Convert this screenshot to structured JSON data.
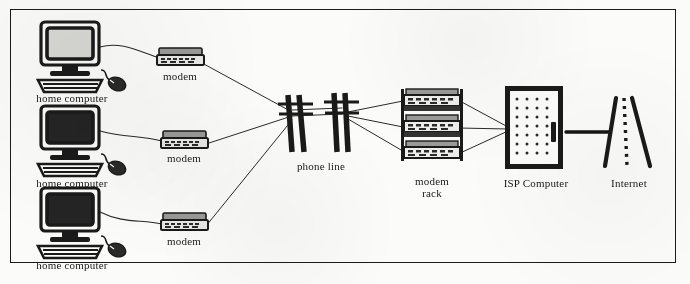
{
  "diagram": {
    "background_color": "#fbfbf9",
    "ink_color": "#1a1a1a",
    "border_color": "#1b1b1b",
    "style": "scanned black and white line drawing"
  },
  "nodes": [
    {
      "id": "home-computer-1",
      "label": "home computer",
      "icon": "desktop-computer-icon",
      "screen": "light",
      "x": 72,
      "y": 55,
      "label_x": 72,
      "label_y": 86
    },
    {
      "id": "home-computer-2",
      "label": "home computer",
      "icon": "desktop-computer-icon",
      "screen": "dark",
      "x": 72,
      "y": 140,
      "label_x": 72,
      "label_y": 171
    },
    {
      "id": "home-computer-3",
      "label": "home computer",
      "icon": "desktop-computer-icon",
      "screen": "dark",
      "x": 72,
      "y": 222,
      "label_x": 72,
      "label_y": 253
    },
    {
      "id": "modem-1",
      "label": "modem",
      "icon": "modem-icon",
      "x": 180,
      "y": 57,
      "label_x": 180,
      "label_y": 72
    },
    {
      "id": "modem-2",
      "label": "modem",
      "icon": "modem-icon",
      "x": 184,
      "y": 140,
      "label_x": 184,
      "label_y": 155
    },
    {
      "id": "modem-3",
      "label": "modem",
      "icon": "modem-icon",
      "x": 184,
      "y": 222,
      "label_x": 184,
      "label_y": 238
    },
    {
      "id": "phone-line",
      "label": "phone line",
      "icon": "telephone-pole-icon",
      "x": 320,
      "y": 125,
      "label_x": 321,
      "label_y": 160
    },
    {
      "id": "modem-rack",
      "label_line1": "modem",
      "label_line2": "rack",
      "icon": "modem-rack-icon",
      "units": 3,
      "x": 432,
      "y": 128,
      "label_x": 432,
      "label_y": 175
    },
    {
      "id": "isp-computer",
      "label": "ISP Computer",
      "icon": "server-cabinet-icon",
      "x": 535,
      "y": 128,
      "label_x": 535,
      "label_y": 177
    },
    {
      "id": "internet",
      "label": "Internet",
      "icon": "road-icon",
      "x": 626,
      "y": 130,
      "label_x": 628,
      "label_y": 177
    }
  ],
  "connections": [
    {
      "from": "home-computer-1",
      "to": "modem-1",
      "style": "thin-curve"
    },
    {
      "from": "home-computer-2",
      "to": "modem-2",
      "style": "thin-curve"
    },
    {
      "from": "home-computer-3",
      "to": "modem-3",
      "style": "thin-curve"
    },
    {
      "from": "modem-1",
      "to": "phone-line",
      "style": "thin-straight"
    },
    {
      "from": "modem-2",
      "to": "phone-line",
      "style": "thin-straight"
    },
    {
      "from": "modem-3",
      "to": "phone-line",
      "style": "thin-straight"
    },
    {
      "from": "phone-line",
      "to": "modem-rack",
      "style": "thin-fan"
    },
    {
      "from": "modem-rack",
      "to": "isp-computer",
      "style": "thin-converge"
    },
    {
      "from": "isp-computer",
      "to": "internet",
      "style": "thick-line"
    }
  ]
}
